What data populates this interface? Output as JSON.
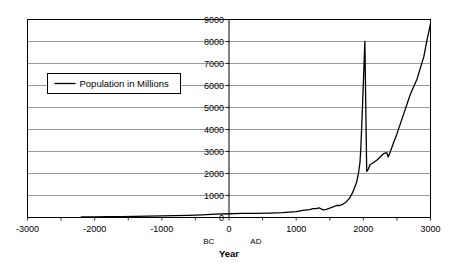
{
  "chart_data": {
    "type": "line",
    "title": "",
    "xlabel": "Year",
    "ylabel": "",
    "xlim": [
      -3000,
      3000
    ],
    "ylim": [
      0,
      9000
    ],
    "grid": true,
    "legend_position": "inside-upper-left",
    "series": [
      {
        "name": "Population in Millions",
        "color": "#000000",
        "x": [
          -2200,
          -2000,
          -1800,
          -1600,
          -1400,
          -1200,
          -1000,
          -800,
          -600,
          -400,
          -200,
          0,
          200,
          400,
          600,
          800,
          1000,
          1100,
          1200,
          1250,
          1300,
          1340,
          1400,
          1450,
          1500,
          1550,
          1600,
          1650,
          1700,
          1750,
          1800,
          1850,
          1900,
          1927,
          1950,
          1960,
          1974,
          1987,
          1999,
          2011,
          2023,
          2050,
          2075,
          2100,
          2200,
          2300,
          2350,
          2370,
          2390,
          2450,
          2500,
          2600,
          2700,
          2800,
          2900,
          2950,
          3000
        ],
        "y": [
          27,
          30,
          35,
          40,
          50,
          60,
          72,
          85,
          100,
          120,
          150,
          170,
          190,
          190,
          200,
          220,
          265,
          320,
          360,
          400,
          400,
          442,
          350,
          374,
          425,
          480,
          545,
          545,
          610,
          720,
          900,
          1200,
          1600,
          2000,
          2500,
          3000,
          4000,
          5000,
          6000,
          7000,
          8000,
          2100,
          2200,
          2400,
          2600,
          2900,
          2950,
          2750,
          2900,
          3400,
          3800,
          4700,
          5600,
          6300,
          7300,
          8100,
          8800
        ],
        "units": "millions"
      }
    ],
    "x_ticks": [
      {
        "value": -3000,
        "label": "-3000"
      },
      {
        "value": -2000,
        "label": "-2000"
      },
      {
        "value": -1000,
        "label": "-1000"
      },
      {
        "value": 0,
        "label": "0"
      },
      {
        "value": 1000,
        "label": "1000"
      },
      {
        "value": 2000,
        "label": "2000"
      },
      {
        "value": 3000,
        "label": "3000"
      }
    ],
    "x_minor_tick_interval": 500,
    "y_ticks": [
      {
        "value": 0,
        "label": "0"
      },
      {
        "value": 1000,
        "label": "1000"
      },
      {
        "value": 2000,
        "label": "2000"
      },
      {
        "value": 3000,
        "label": "3000"
      },
      {
        "value": 4000,
        "label": "4000"
      },
      {
        "value": 5000,
        "label": "5000"
      },
      {
        "value": 6000,
        "label": "6000"
      },
      {
        "value": 7000,
        "label": "7000"
      },
      {
        "value": 8000,
        "label": "8000"
      },
      {
        "value": 9000,
        "label": "9000"
      }
    ],
    "annotations": [
      {
        "name": "bc-label",
        "text": "BC",
        "x": -300
      },
      {
        "name": "ad-label",
        "text": "AD",
        "x": 400
      }
    ]
  },
  "legend": {
    "entries": [
      {
        "label": "Population in Millions",
        "color": "#000000"
      }
    ]
  },
  "axis": {
    "x_title": "Year"
  },
  "colors": {
    "background": "#ffffff",
    "plot_border": "#000000",
    "gridline": "#808080",
    "series": "#000000",
    "text": "#000000"
  }
}
